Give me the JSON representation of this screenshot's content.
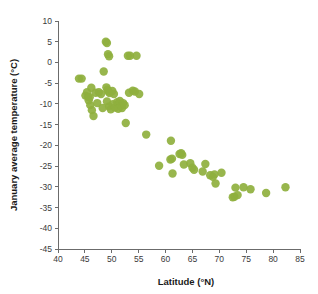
{
  "chart_data": {
    "type": "scatter",
    "title": "",
    "xlabel": "Latitude (°N)",
    "ylabel": "January average temperature (°C)",
    "xlim": [
      40,
      85
    ],
    "ylim": [
      -45,
      10
    ],
    "xticks": [
      40,
      45,
      50,
      55,
      60,
      65,
      70,
      75,
      80,
      85
    ],
    "yticks": [
      10,
      5,
      0,
      -5,
      -10,
      -15,
      -20,
      -25,
      -30,
      -35,
      -40,
      -45
    ],
    "xtick_labels": [
      "40",
      "45",
      "50",
      "55",
      "60",
      "65",
      "70",
      "75",
      "80",
      "85"
    ],
    "ytick_labels": [
      "10",
      "5",
      "0",
      "-5",
      "-10",
      "-15",
      "-20",
      "-25",
      "-30",
      "-35",
      "-40",
      "-45"
    ],
    "grid": false,
    "legend": null,
    "marker_color": "#8fb03e",
    "marker_size": 4.2,
    "series": [
      {
        "name": "Cities",
        "points": [
          [
            43.9,
            -3.9
          ],
          [
            44.4,
            -3.9
          ],
          [
            45.1,
            -8.0
          ],
          [
            45.4,
            -7.2
          ],
          [
            45.6,
            -8.3
          ],
          [
            45.7,
            -9.1
          ],
          [
            45.9,
            -8.4
          ],
          [
            46.0,
            -10.3
          ],
          [
            46.2,
            -6.1
          ],
          [
            46.3,
            -11.5
          ],
          [
            46.6,
            -12.9
          ],
          [
            47.0,
            -7.3
          ],
          [
            47.3,
            -9.8
          ],
          [
            47.6,
            -7.2
          ],
          [
            48.0,
            -7.6
          ],
          [
            48.3,
            -11.0
          ],
          [
            48.5,
            -2.2
          ],
          [
            48.9,
            5.0
          ],
          [
            49.1,
            4.7
          ],
          [
            49.3,
            2.0
          ],
          [
            49.5,
            1.5
          ],
          [
            49.0,
            -6.0
          ],
          [
            49.2,
            -6.6
          ],
          [
            49.4,
            -7.0
          ],
          [
            49.6,
            -7.4
          ],
          [
            49.1,
            -9.4
          ],
          [
            49.5,
            -10.6
          ],
          [
            49.8,
            -11.3
          ],
          [
            50.1,
            -6.9
          ],
          [
            50.4,
            -7.6
          ],
          [
            50.2,
            -10.1
          ],
          [
            50.6,
            -10.9
          ],
          [
            51.0,
            -9.6
          ],
          [
            51.3,
            -10.0
          ],
          [
            51.5,
            -9.3
          ],
          [
            51.7,
            -10.5
          ],
          [
            51.2,
            -11.2
          ],
          [
            51.9,
            -11.0
          ],
          [
            52.1,
            -9.8
          ],
          [
            52.4,
            -10.3
          ],
          [
            52.6,
            -14.6
          ],
          [
            53.0,
            1.6
          ],
          [
            53.4,
            1.6
          ],
          [
            54.6,
            1.6
          ],
          [
            53.2,
            -7.3
          ],
          [
            53.9,
            -6.8
          ],
          [
            54.3,
            -7.0
          ],
          [
            55.1,
            -7.6
          ],
          [
            56.4,
            -17.4
          ],
          [
            58.8,
            -24.9
          ],
          [
            60.9,
            -23.4
          ],
          [
            61.0,
            -18.9
          ],
          [
            61.2,
            -23.2
          ],
          [
            61.3,
            -26.8
          ],
          [
            62.6,
            -22.1
          ],
          [
            62.9,
            -21.9
          ],
          [
            63.1,
            -22.3
          ],
          [
            63.4,
            -24.6
          ],
          [
            64.6,
            -24.3
          ],
          [
            65.0,
            -25.4
          ],
          [
            65.3,
            -25.9
          ],
          [
            66.9,
            -26.3
          ],
          [
            67.4,
            -24.5
          ],
          [
            68.3,
            -27.2
          ],
          [
            68.8,
            -27.6
          ],
          [
            69.1,
            -27.0
          ],
          [
            69.3,
            -29.2
          ],
          [
            70.4,
            -26.6
          ],
          [
            72.5,
            -32.5
          ],
          [
            72.8,
            -32.4
          ],
          [
            73.0,
            -30.2
          ],
          [
            73.4,
            -32.0
          ],
          [
            74.5,
            -30.1
          ],
          [
            75.8,
            -30.6
          ],
          [
            78.7,
            -31.5
          ],
          [
            82.3,
            -30.1
          ]
        ]
      }
    ]
  },
  "axes": {
    "x_axis_name": "latitude-axis",
    "y_axis_name": "temperature-axis"
  }
}
